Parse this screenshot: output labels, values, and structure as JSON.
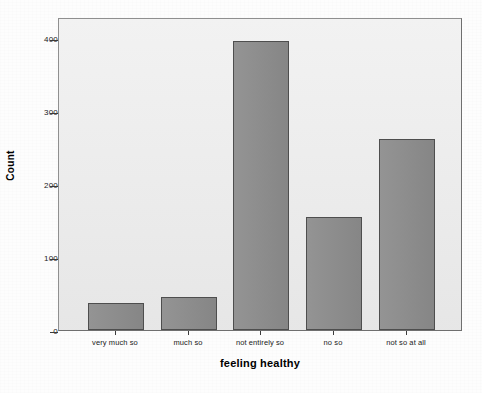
{
  "chart_data": {
    "type": "bar",
    "title": "",
    "subtitle": "",
    "xlabel": "feeling healthy",
    "ylabel": "Count",
    "categories": [
      "very much so",
      "much so",
      "not entirely so",
      "no so",
      "not so at all"
    ],
    "values": [
      37,
      45,
      399,
      156,
      264
    ],
    "ylim": [
      0,
      430
    ],
    "yticks": [
      0,
      100,
      200,
      300,
      400
    ],
    "ytick_labels": [
      "0",
      "100",
      "200",
      "300",
      "400"
    ],
    "grid": false,
    "legend": false,
    "legend_position": "none",
    "bar_color": "#8d8d8d",
    "bar_edge_color": "#4e4e4e",
    "plot_background": "#ebebeb",
    "frame_color": "#8f8f8f",
    "figure_background": "#fdfdfd"
  }
}
